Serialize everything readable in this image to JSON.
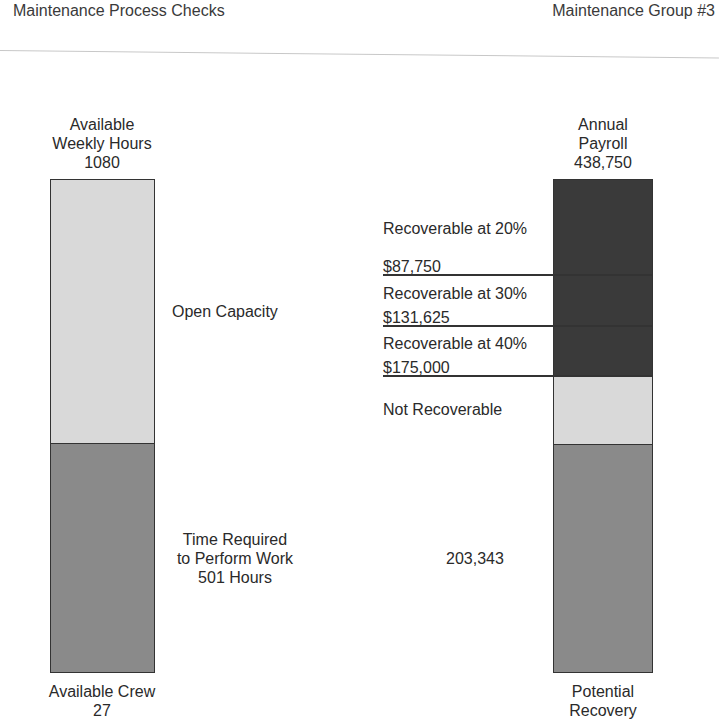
{
  "header": {
    "left_title": "Maintenance Process Checks",
    "right_title": "Maintenance Group #3"
  },
  "left_bar": {
    "top_label_1": "Available",
    "top_label_2": "Weekly Hours",
    "top_value": "1080",
    "segments": [
      {
        "name": "open-capacity",
        "label": "Open Capacity",
        "color": "#d9d9d9"
      },
      {
        "name": "time-required",
        "label_1": "Time Required",
        "label_2": "to Perform Work",
        "label_3": "501 Hours",
        "color": "#8a8a8a"
      }
    ],
    "bottom_label": "Available Crew",
    "bottom_value": "27"
  },
  "right_bar": {
    "top_label_1": "Annual",
    "top_label_2": "Payroll",
    "top_value": "438,750",
    "tiers": [
      {
        "label": "Recoverable at 20%",
        "amount": "$87,750"
      },
      {
        "label": "Recoverable at 30%",
        "amount": "$131,625"
      },
      {
        "label": "Recoverable at 40%",
        "amount": "$175,000"
      }
    ],
    "not_recoverable_label": "Not Recoverable",
    "potential_value": "203,343",
    "bottom_label_1": "Potential",
    "bottom_label_2": "Recovery",
    "colors": {
      "recoverable": "#3a3a3a",
      "not_recoverable": "#d9d9d9",
      "potential": "#8a8a8a"
    }
  }
}
